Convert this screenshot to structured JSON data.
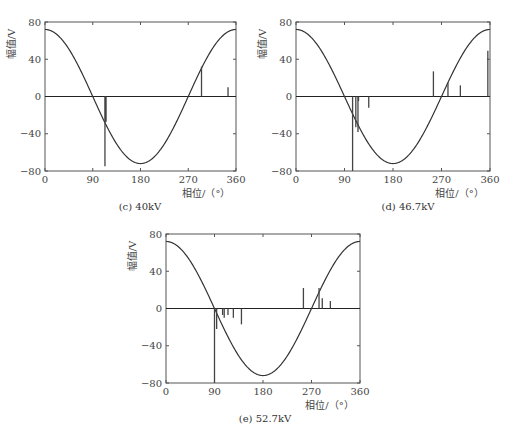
{
  "chart_data": [
    {
      "id": "c",
      "type": "line+stem",
      "caption": "(c) 40kV",
      "xlabel": "相位/（°）",
      "ylabel": "幅值/V",
      "xlim": [
        0,
        360
      ],
      "ylim": [
        -80,
        80
      ],
      "xticks": [
        0,
        90,
        180,
        270,
        360
      ],
      "yticks": [
        80,
        40,
        0,
        -40,
        -80
      ],
      "reference_wave": {
        "type": "cosine",
        "amplitude": 72
      },
      "pulses": [
        {
          "phase": 113,
          "amplitude": -75
        },
        {
          "phase": 114,
          "amplitude": -27
        },
        {
          "phase": 115,
          "amplitude": -27
        },
        {
          "phase": 295,
          "amplitude": 32
        },
        {
          "phase": 345,
          "amplitude": 10
        }
      ]
    },
    {
      "id": "d",
      "type": "line+stem",
      "caption": "(d) 46.7kV",
      "xlabel": "相位/（°）",
      "ylabel": "幅值/V",
      "xlim": [
        0,
        360
      ],
      "ylim": [
        -80,
        80
      ],
      "xticks": [
        0,
        90,
        180,
        270,
        360
      ],
      "yticks": [
        80,
        40,
        0,
        -40,
        -80
      ],
      "reference_wave": {
        "type": "cosine",
        "amplitude": 72
      },
      "pulses": [
        {
          "phase": 105,
          "amplitude": -80
        },
        {
          "phase": 111,
          "amplitude": -33
        },
        {
          "phase": 115,
          "amplitude": -38
        },
        {
          "phase": 116,
          "amplitude": -5
        },
        {
          "phase": 135,
          "amplitude": -12
        },
        {
          "phase": 255,
          "amplitude": 27
        },
        {
          "phase": 282,
          "amplitude": 15
        },
        {
          "phase": 305,
          "amplitude": 12
        },
        {
          "phase": 356,
          "amplitude": 49
        }
      ]
    },
    {
      "id": "e",
      "type": "line+stem",
      "caption": "(e) 52.7kV",
      "xlabel": "相位/（°）",
      "ylabel": "幅值/V",
      "xlim": [
        0,
        360
      ],
      "ylim": [
        -80,
        80
      ],
      "xticks": [
        0,
        90,
        180,
        270,
        360
      ],
      "yticks": [
        80,
        40,
        0,
        -40,
        -80
      ],
      "reference_wave": {
        "type": "cosine",
        "amplitude": 72
      },
      "pulses": [
        {
          "phase": 90,
          "amplitude": -80
        },
        {
          "phase": 94,
          "amplitude": -22
        },
        {
          "phase": 105,
          "amplitude": -7
        },
        {
          "phase": 108,
          "amplitude": -10
        },
        {
          "phase": 115,
          "amplitude": -7
        },
        {
          "phase": 125,
          "amplitude": -10
        },
        {
          "phase": 140,
          "amplitude": -17
        },
        {
          "phase": 255,
          "amplitude": 22
        },
        {
          "phase": 284,
          "amplitude": 22
        },
        {
          "phase": 290,
          "amplitude": 11
        },
        {
          "phase": 305,
          "amplitude": 8
        }
      ]
    }
  ]
}
